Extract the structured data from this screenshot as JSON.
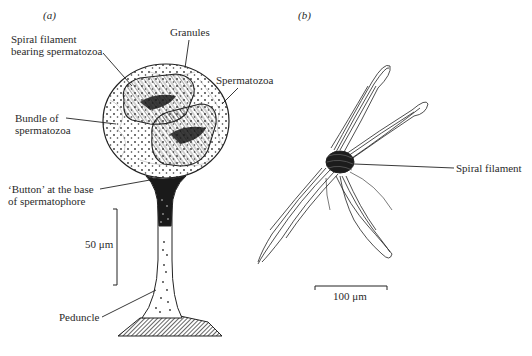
{
  "figure": {
    "panels": [
      {
        "id": "a",
        "label": "(a)",
        "annotations": {
          "spiral_filament_line1": "Spiral filament",
          "spiral_filament_line2": "bearing spermatozoa",
          "granules": "Granules",
          "spermatozoa": "Spermatozoa",
          "bundle_line1": "Bundle of",
          "bundle_line2": "spermatozoa",
          "button_line1": "‘Button’ at the base",
          "button_line2": "of spermatophore",
          "peduncle": "Peduncle"
        },
        "scale_bar": {
          "label": "50 μm",
          "orientation": "vertical"
        }
      },
      {
        "id": "b",
        "label": "(b)",
        "annotations": {
          "spiral_filament": "Spiral filament"
        },
        "scale_bar": {
          "label": "100 μm",
          "orientation": "horizontal"
        }
      }
    ],
    "colors": {
      "ink": "#222222",
      "background": "#ffffff"
    }
  }
}
